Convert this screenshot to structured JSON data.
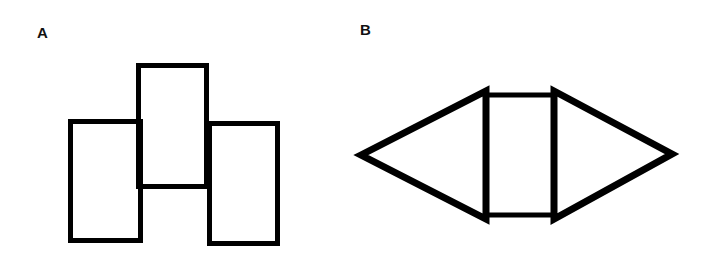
{
  "panels": [
    {
      "label": "A",
      "description": "Three rectangles: center rectangle raised, flanked by two lower rectangles",
      "shapes": [
        {
          "type": "rect",
          "name": "left-rectangle",
          "x": 70,
          "y": 121,
          "w": 71,
          "h": 120
        },
        {
          "type": "rect",
          "name": "middle-rectangle",
          "x": 138,
          "y": 65,
          "w": 69,
          "h": 122
        },
        {
          "type": "rect",
          "name": "right-rectangle",
          "x": 209,
          "y": 123,
          "w": 69,
          "h": 121
        }
      ]
    },
    {
      "label": "B",
      "description": "Rectangle flanked by two triangles forming a hexagonal/diamond shape",
      "shapes": [
        {
          "type": "polygon",
          "name": "left-triangle",
          "points": "361,155 486,91 486,219"
        },
        {
          "type": "rect",
          "name": "middle-rectangle",
          "x": 485,
          "y": 94,
          "w": 69,
          "h": 121
        },
        {
          "type": "polygon",
          "name": "right-triangle",
          "points": "554,91 672,154 554,219"
        }
      ]
    }
  ],
  "style": {
    "stroke": "#000000",
    "fill": "none"
  }
}
